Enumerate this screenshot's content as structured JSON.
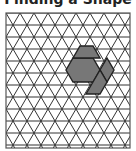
{
  "title": "Finding a Shape",
  "diagram": {
    "type": "triangular-grid-puzzle",
    "line_color": "#333333",
    "fill_color": "#777777",
    "background": "#ffffff",
    "highlighted_shapes": [
      "hexagon",
      "rhombus",
      "trapezoid"
    ]
  }
}
